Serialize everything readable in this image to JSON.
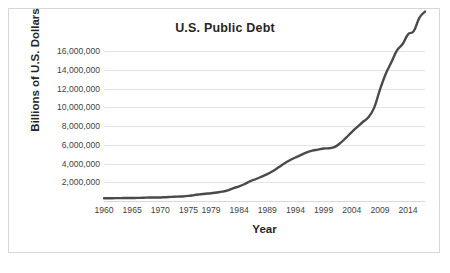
{
  "chart_data": {
    "type": "line",
    "title": "U.S. Public Debt",
    "xlabel": "Year",
    "ylabel": "Billions of U.S. Dollars",
    "xlim": [
      1960,
      2017
    ],
    "ylim": [
      0,
      16000000
    ],
    "grid": true,
    "grid_axis": "y",
    "legend": "none",
    "line_color": "#4a4a4a",
    "gridline_color": "#e4e4e4",
    "background_color": "#ffffff",
    "border_color": "#d7d7d7",
    "y_ticks": [
      2000000,
      4000000,
      6000000,
      8000000,
      10000000,
      12000000,
      14000000,
      16000000
    ],
    "y_tick_labels": [
      "2,000,000",
      "4,000,000",
      "6,000,000",
      "8,000,000",
      "10,000,000",
      "12,000,000",
      "14,000,000",
      "16,000,000"
    ],
    "x_ticks": [
      1960,
      1965,
      1970,
      1975,
      1979,
      1984,
      1989,
      1994,
      1999,
      2004,
      2009,
      2014
    ],
    "x_tick_labels": [
      "1960",
      "1965",
      "1970",
      "1975",
      "1979",
      "1984",
      "1989",
      "1994",
      "1999",
      "2004",
      "2009",
      "2014"
    ],
    "series": [
      {
        "name": "U.S. Public Debt",
        "x": [
          1960,
          1961,
          1962,
          1963,
          1964,
          1965,
          1966,
          1967,
          1968,
          1969,
          1970,
          1971,
          1972,
          1973,
          1974,
          1975,
          1976,
          1977,
          1978,
          1979,
          1980,
          1981,
          1982,
          1983,
          1984,
          1985,
          1986,
          1987,
          1988,
          1989,
          1990,
          1991,
          1992,
          1993,
          1994,
          1995,
          1996,
          1997,
          1998,
          1999,
          2000,
          2001,
          2002,
          2003,
          2004,
          2005,
          2006,
          2007,
          2008,
          2009,
          2010,
          2011,
          2012,
          2013,
          2014,
          2015,
          2016,
          2017
        ],
        "values": [
          290000,
          293000,
          303000,
          310000,
          316000,
          322000,
          329000,
          341000,
          369000,
          367000,
          381000,
          408000,
          436000,
          466000,
          484000,
          541000,
          629000,
          706000,
          777000,
          829000,
          909000,
          995000,
          1137000,
          1372000,
          1565000,
          1817000,
          2120000,
          2346000,
          2601000,
          2868000,
          3206000,
          3598000,
          4002000,
          4351000,
          4643000,
          4921000,
          5181000,
          5369000,
          5478000,
          5605000,
          5628000,
          5769000,
          6198000,
          6760000,
          7355000,
          7905000,
          8451000,
          8950000,
          9986000,
          11876000,
          13529000,
          14764000,
          16050000,
          16719000,
          17794000,
          18120000,
          19540000,
          20200000
        ],
        "values_note_scale": "plotted in units matching y-axis labels"
      }
    ],
    "plotted_points": [
      {
        "year": 1960,
        "value": 290000
      },
      {
        "year": 1965,
        "value": 322000
      },
      {
        "year": 1970,
        "value": 381000
      },
      {
        "year": 1975,
        "value": 541000
      },
      {
        "year": 1979,
        "value": 829000
      },
      {
        "year": 1984,
        "value": 1565000
      },
      {
        "year": 1989,
        "value": 2868000
      },
      {
        "year": 1994,
        "value": 3400000
      },
      {
        "year": 1997,
        "value": 3900000
      },
      {
        "year": 1999,
        "value": 3650000
      },
      {
        "year": 2001,
        "value": 3380000
      },
      {
        "year": 2004,
        "value": 4300000
      },
      {
        "year": 2007,
        "value": 5100000
      },
      {
        "year": 2009,
        "value": 7600000
      },
      {
        "year": 2011,
        "value": 10000000
      },
      {
        "year": 2014,
        "value": 12900000
      },
      {
        "year": 2016,
        "value": 14800000
      }
    ]
  }
}
